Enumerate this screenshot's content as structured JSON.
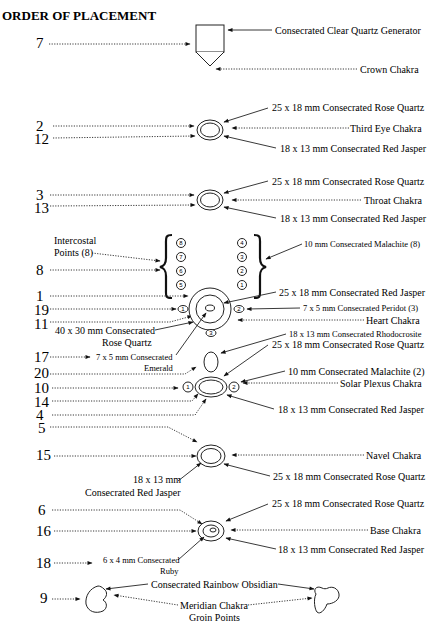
{
  "title": "ORDER OF PLACEMENT",
  "groups": [
    {
      "id": "crown",
      "numbers": [
        "7"
      ],
      "labels": [
        "Consecrated Clear Quartz Generator",
        "Crown Chakra"
      ]
    },
    {
      "id": "third-eye",
      "numbers": [
        "2",
        "12"
      ],
      "labels": [
        "25 x 18 mm Consecrated Rose Quartz",
        "Third Eye Chakra",
        "18 x 13 mm Consecrated Red Jasper"
      ]
    },
    {
      "id": "throat",
      "numbers": [
        "3",
        "13"
      ],
      "labels": [
        "25 x 18 mm Consecrated Rose Quartz",
        "Throat Chakra",
        "18 x 13 mm Consecrated Red Jasper"
      ]
    },
    {
      "id": "intercostal",
      "numbers": [
        "8"
      ],
      "labels": [
        "Intercostal",
        "Points (8)",
        "10 mm Consecrated Malachite (8)"
      ],
      "left_column": [
        "8",
        "7",
        "6",
        "5"
      ],
      "right_column": [
        "4",
        "3",
        "2",
        "1"
      ]
    },
    {
      "id": "heart",
      "numbers": [
        "1",
        "19",
        "11"
      ],
      "labels": [
        "25 x 18 mm Consecrated Red Jasper",
        "7 x 5 mm Consecrated Peridot (3)",
        "Heart Chakra",
        "40 x 30 mm Consecrated",
        "Rose Quartz"
      ],
      "peridot_markers": [
        "1",
        "2",
        "3"
      ]
    },
    {
      "id": "solar-plexus",
      "numbers": [
        "17",
        "20",
        "10",
        "14",
        "4"
      ],
      "labels": [
        "7 x 5 mm Consecrated",
        "Emerald",
        "18 x 13 mm Consecrated Rhodocrosite",
        "25 x 18 mm Consecrated Rose Quartz",
        "10 mm Consecrated Malachite (2)",
        "Solar Plexus Chakra",
        "18 x 13 mm Consecrated Red Jasper"
      ],
      "malachite_markers": [
        "1",
        "2"
      ]
    },
    {
      "id": "navel",
      "numbers": [
        "5",
        "15"
      ],
      "labels": [
        "Navel Chakra",
        "18 x 13 mm",
        "Consecrated Red Jasper",
        "25 x 18 mm Consecrated Rose Quartz"
      ]
    },
    {
      "id": "base",
      "numbers": [
        "6",
        "16",
        "18"
      ],
      "labels": [
        "25 x 18 mm Consecrated Rose Quartz",
        "Base Chakra",
        "18 x 13 mm Consecrated Red Jasper",
        "6 x 4 mm Consecrated",
        "Ruby"
      ]
    },
    {
      "id": "groin",
      "numbers": [
        "9"
      ],
      "labels": [
        "Consecrated Rainbow Obsidian",
        "Meridian Chakra",
        "Groin Points"
      ]
    }
  ]
}
